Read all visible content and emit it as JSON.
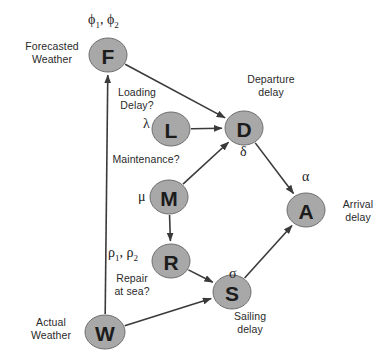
{
  "diagram": {
    "node_fill": "#a8a8a8",
    "node_stroke": "#6e6e6e",
    "edge_color": "#3a3a3a",
    "background": "#ffffff",
    "nodes": [
      {
        "id": "F",
        "letter": "F",
        "cx": 108,
        "cy": 55,
        "rx": 19,
        "ry": 17,
        "meaning": "Forecasted Weather"
      },
      {
        "id": "L",
        "letter": "L",
        "cx": 171,
        "cy": 129,
        "rx": 19,
        "ry": 17,
        "meaning": "Loading Delay"
      },
      {
        "id": "D",
        "letter": "D",
        "cx": 244,
        "cy": 128,
        "rx": 19,
        "ry": 17,
        "meaning": "Departure delay"
      },
      {
        "id": "M",
        "letter": "M",
        "cx": 169,
        "cy": 197,
        "rx": 19,
        "ry": 17,
        "meaning": "Maintenance"
      },
      {
        "id": "R",
        "letter": "R",
        "cx": 171,
        "cy": 261,
        "rx": 19,
        "ry": 17,
        "meaning": "Repair at sea"
      },
      {
        "id": "A",
        "letter": "A",
        "cx": 306,
        "cy": 210,
        "rx": 19,
        "ry": 17,
        "meaning": "Arrival delay"
      },
      {
        "id": "S",
        "letter": "S",
        "cx": 232,
        "cy": 292,
        "rx": 19,
        "ry": 17,
        "meaning": "Sailing delay"
      },
      {
        "id": "W",
        "letter": "W",
        "cx": 105,
        "cy": 332,
        "rx": 20,
        "ry": 17,
        "meaning": "Actual Weather"
      }
    ],
    "edges": [
      {
        "from": "F",
        "to": "D",
        "label": ""
      },
      {
        "from": "L",
        "to": "D",
        "label": ""
      },
      {
        "from": "M",
        "to": "D",
        "label": ""
      },
      {
        "from": "M",
        "to": "R",
        "label": ""
      },
      {
        "from": "R",
        "to": "S",
        "label": ""
      },
      {
        "from": "D",
        "to": "A",
        "label": ""
      },
      {
        "from": "S",
        "to": "A",
        "label": ""
      },
      {
        "from": "W",
        "to": "F",
        "label": ""
      },
      {
        "from": "W",
        "to": "S",
        "label": ""
      }
    ],
    "text_labels": [
      {
        "name": "forecasted-weather-label",
        "text": "Forecasted\nWeather",
        "x": 14,
        "y": 40,
        "width": 76
      },
      {
        "name": "loading-delay-label",
        "text": "Loading\nDelay?",
        "x": 110,
        "y": 86,
        "width": 54
      },
      {
        "name": "departure-delay-label",
        "text": "Departure\ndelay",
        "x": 240,
        "y": 73,
        "width": 62
      },
      {
        "name": "maintenance-label",
        "text": "Maintenance?",
        "x": 108,
        "y": 153,
        "width": 76
      },
      {
        "name": "arrival-delay-label",
        "text": "Arrival\ndelay",
        "x": 334,
        "y": 198,
        "width": 48
      },
      {
        "name": "repair-at-sea-label",
        "text": "Repair\nat sea?",
        "x": 108,
        "y": 272,
        "width": 48
      },
      {
        "name": "sailing-delay-label",
        "text": "Sailing\ndelay",
        "x": 226,
        "y": 310,
        "width": 48
      },
      {
        "name": "actual-weather-label",
        "text": "Actual\nWeather",
        "x": 18,
        "y": 316,
        "width": 66
      }
    ],
    "parameters": [
      {
        "name": "phi-parameter",
        "html": "ϕ<sub>1</sub>, ϕ<sub>2</sub>",
        "plain": "ϕ1, ϕ2",
        "x": 88,
        "y": 12
      },
      {
        "name": "lambda-parameter",
        "html": "λ",
        "plain": "λ",
        "x": 143,
        "y": 116
      },
      {
        "name": "delta-parameter",
        "html": "δ",
        "plain": "δ",
        "x": 240,
        "y": 144
      },
      {
        "name": "mu-parameter",
        "html": "μ",
        "plain": "μ",
        "x": 138,
        "y": 189
      },
      {
        "name": "alpha-parameter",
        "html": "α",
        "plain": "α",
        "x": 302,
        "y": 169
      },
      {
        "name": "rho-parameter",
        "html": "ρ<sub>1</sub>, ρ<sub>2</sub>",
        "plain": "ρ1, ρ2",
        "x": 108,
        "y": 245
      },
      {
        "name": "sigma-parameter",
        "html": "σ",
        "plain": "σ",
        "x": 229,
        "y": 266
      }
    ]
  }
}
